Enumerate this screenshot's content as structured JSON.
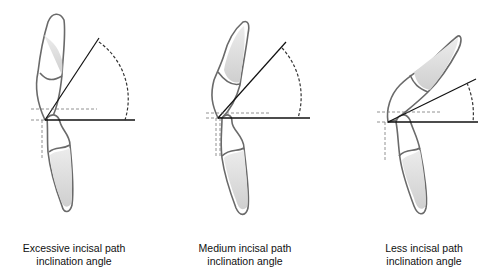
{
  "panels": [
    {
      "id": "excessive",
      "line1": "Excessive incisal path",
      "line2": "inclination angle",
      "angle_deg": 57
    },
    {
      "id": "medium",
      "line1": "Medium incisal path",
      "line2": "inclination angle",
      "angle_deg": 48
    },
    {
      "id": "less",
      "line1": "Less incisal path",
      "line2": "inclination angle",
      "angle_deg": 26
    }
  ],
  "colors": {
    "outline": "#6a6a6a",
    "line": "#111111",
    "dash": "#333333",
    "fill": "#d9d9d9"
  }
}
